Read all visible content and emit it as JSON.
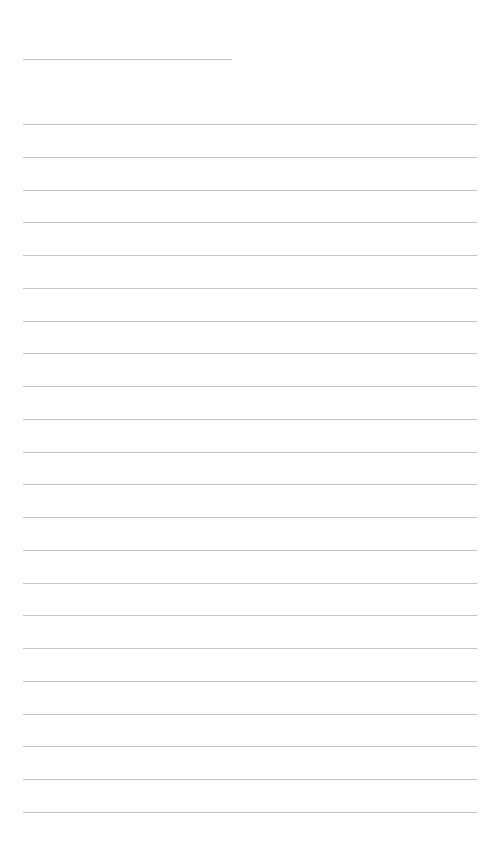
{
  "document": {
    "type": "lined-notepaper",
    "background_color": "#ffffff",
    "rule_color": "#c4c4c4",
    "title_line": {
      "x": 23,
      "y": 59,
      "width": 209,
      "text": ""
    },
    "lines": {
      "count": 22,
      "x": 23,
      "width": 454,
      "first_y": 124,
      "spacing": 32.76,
      "entries": [
        "",
        "",
        "",
        "",
        "",
        "",
        "",
        "",
        "",
        "",
        "",
        "",
        "",
        "",
        "",
        "",
        "",
        "",
        "",
        "",
        "",
        ""
      ]
    }
  }
}
